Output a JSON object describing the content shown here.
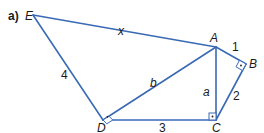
{
  "figure": {
    "part_label": "a)",
    "edge_color": "#3a6ab5",
    "vertices": {
      "E": {
        "label": "E",
        "x": 33,
        "y": 15
      },
      "A": {
        "label": "A",
        "x": 216,
        "y": 47
      },
      "B": {
        "label": "B",
        "x": 246,
        "y": 64
      },
      "C": {
        "label": "C",
        "x": 216,
        "y": 120
      },
      "D": {
        "label": "D",
        "x": 103,
        "y": 120
      }
    },
    "edges": {
      "EA": {
        "label": "x"
      },
      "ED": {
        "label": "4"
      },
      "AB": {
        "label": "1"
      },
      "BC": {
        "label": "2"
      },
      "AC": {
        "label": "a"
      },
      "AD": {
        "label": "b"
      },
      "DC": {
        "label": "3"
      }
    },
    "right_angles": [
      "B",
      "C",
      "D"
    ]
  }
}
